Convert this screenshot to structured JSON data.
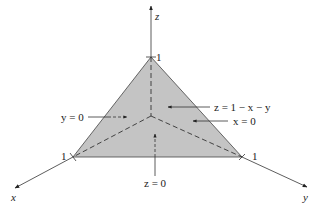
{
  "diagram": {
    "colors": {
      "face_fill": "#c4c4c4",
      "line": "#333333",
      "background": "#ffffff"
    },
    "axes": {
      "z": {
        "label": "z",
        "tick_label": "1"
      },
      "x": {
        "label": "x",
        "tick_label": "1"
      },
      "y": {
        "label": "y",
        "tick_label": "1"
      }
    },
    "annotations": {
      "y0": "y = 0",
      "plane": "z = 1 − x − y",
      "x0": "x = 0",
      "z0": "z = 0"
    }
  }
}
